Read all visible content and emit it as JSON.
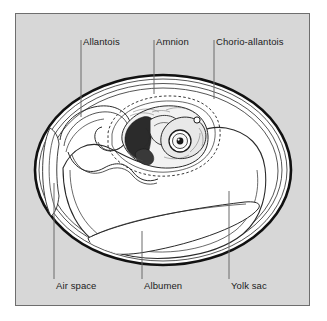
{
  "figure": {
    "panel_background": "#d7d7d7",
    "panel_border": "#6e6e6e",
    "ink_color": "#1b1b1b",
    "egg_fill": "#ffffff"
  },
  "labels": {
    "top": [
      {
        "id": "allantois",
        "text": "Allantois",
        "x": 83,
        "y": 36,
        "tick_x": 81,
        "line_from_y": 40,
        "line_to_y": 117
      },
      {
        "id": "amnion",
        "text": "Amnion",
        "x": 156,
        "y": 36,
        "tick_x": 154,
        "line_from_y": 40,
        "line_to_y": 94
      },
      {
        "id": "chorio-allantois",
        "text": "Chorio-allantois",
        "x": 216,
        "y": 36,
        "tick_x": 214,
        "line_from_y": 40,
        "line_to_y": 99
      }
    ],
    "bottom": [
      {
        "id": "air-space",
        "text": "Air space",
        "x": 55,
        "y": 280,
        "tick_x": 54,
        "line_from_y": 183,
        "line_to_y": 279
      },
      {
        "id": "albumen",
        "text": "Albumen",
        "x": 143,
        "y": 280,
        "tick_x": 142,
        "line_from_y": 231,
        "line_to_y": 279
      },
      {
        "id": "yolk-sac",
        "text": "Yolk sac",
        "x": 230,
        "y": 280,
        "tick_x": 229,
        "line_from_y": 191,
        "line_to_y": 279
      }
    ]
  },
  "structures": [
    {
      "name": "eggshell",
      "description": "outer oval shell with heavy dark outline"
    },
    {
      "name": "shell-membrane",
      "description": "thin inner line following the shell"
    },
    {
      "name": "air-space",
      "description": "narrow crescent wedge at the blunt left end"
    },
    {
      "name": "chorio-allantois",
      "description": "membrane lining the shell interior"
    },
    {
      "name": "allantois",
      "description": "looped membrane folding down on the left of the embryo"
    },
    {
      "name": "amnion",
      "description": "dashed sac enclosing the embryo"
    },
    {
      "name": "embryo",
      "description": "shaded curled chick embryo with large eye, upper middle"
    },
    {
      "name": "yolk-sac",
      "description": "large white mass filling the lower two-thirds of the egg"
    },
    {
      "name": "albumen",
      "description": "thin lens-shaped layer along the bottom of the egg"
    }
  ]
}
